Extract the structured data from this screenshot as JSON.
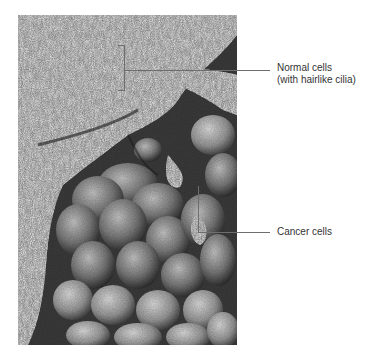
{
  "figure": {
    "image_alt": "Scanning electron micrograph of a bronchial surface showing normal ciliated cells and a cluster of cancer cells",
    "labels": [
      {
        "id": "normal",
        "line1": "Normal cells",
        "line2": "(with hairlike cilia)"
      },
      {
        "id": "cancer",
        "line1": "Cancer cells"
      }
    ]
  },
  "colors": {
    "background": "#ffffff",
    "leader_line": "#6e6e6e",
    "label_text": "#333333"
  }
}
